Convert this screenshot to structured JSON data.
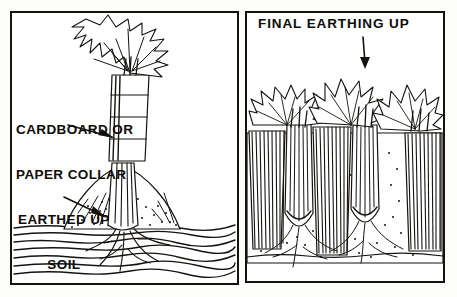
{
  "illustration": {
    "title": "Celery earthing up — two stage diagram",
    "style": "black and white line drawing",
    "ink_color": "#16130f",
    "paper_color": "#ffffff"
  },
  "panels": [
    {
      "id": "left",
      "name": "collar-and-earthing-stage",
      "labels": [
        {
          "id": "collar",
          "line1": "CARDBOARD OR",
          "line2": "PAPER COLLAR",
          "pointer": "arrow-to-collar"
        },
        {
          "id": "soil",
          "line1": "EARTHED UP",
          "line2": "SOIL",
          "pointer": "arrow-to-soil-mound"
        }
      ],
      "elements": [
        "celery-plant",
        "leafy-top",
        "paper-collar",
        "soil-mound",
        "ground-line",
        "roots"
      ]
    },
    {
      "id": "right",
      "name": "final-earthing-stage",
      "title": "FINAL EARTHING UP",
      "title_pointer": "down-arrow",
      "elements": [
        "celery-row",
        "blanched-stems",
        "soil-ridges",
        "leafy-tops",
        "roots",
        "ground-line"
      ],
      "plant_count": 3
    }
  ]
}
